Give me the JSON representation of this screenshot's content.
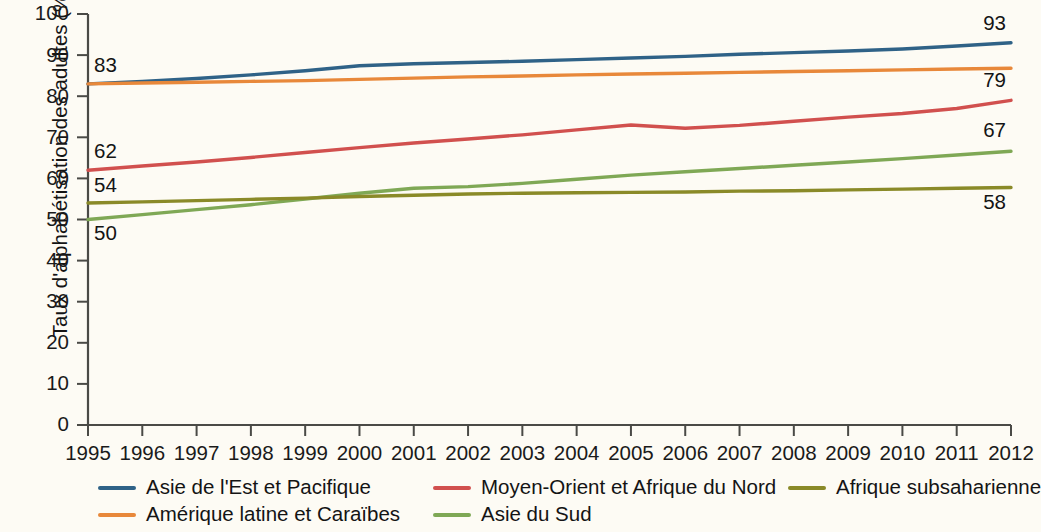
{
  "chart_data": {
    "type": "line",
    "title": "",
    "subtitle": "",
    "xlabel": "",
    "ylabel": "Taux d'alphabétisation des adultes (%)",
    "xlim": [
      1995,
      2012
    ],
    "ylim": [
      0,
      100
    ],
    "grid": false,
    "legend_position": "bottom",
    "x": [
      1995,
      1996,
      1997,
      1998,
      1999,
      2000,
      2001,
      2002,
      2003,
      2004,
      2005,
      2006,
      2007,
      2008,
      2009,
      2010,
      2011,
      2012
    ],
    "xtick_labels": [
      "1995",
      "1996",
      "1997",
      "1998",
      "1999",
      "2000",
      "2001",
      "2002",
      "2003",
      "2004",
      "2005",
      "2006",
      "2007",
      "2008",
      "2009",
      "2010",
      "2011",
      "2012"
    ],
    "ytick_labels": [
      "0",
      "10",
      "20",
      "30",
      "40",
      "50",
      "60",
      "70",
      "80",
      "90",
      "100"
    ],
    "ytick_values": [
      0,
      10,
      20,
      30,
      40,
      50,
      60,
      70,
      80,
      90,
      100
    ],
    "series": [
      {
        "name": "Asie de l'Est et Pacifique",
        "color": "#2f6287",
        "values": [
          83.0,
          83.6,
          84.3,
          85.2,
          86.2,
          87.4,
          87.9,
          88.2,
          88.5,
          88.9,
          89.3,
          89.7,
          90.2,
          90.6,
          91.0,
          91.5,
          92.2,
          93.0
        ],
        "start_label": "83",
        "end_label": "93"
      },
      {
        "name": "Amérique latine et Caraïbes",
        "color": "#e8883a",
        "values": [
          83.0,
          83.2,
          83.4,
          83.6,
          83.8,
          84.1,
          84.4,
          84.7,
          84.9,
          85.2,
          85.4,
          85.6,
          85.8,
          86.0,
          86.2,
          86.4,
          86.6,
          86.8
        ],
        "start_label": "",
        "end_label": ""
      },
      {
        "name": "Moyen-Orient et Afrique du Nord",
        "color": "#d1504e",
        "values": [
          62.0,
          63.0,
          64.0,
          65.1,
          66.3,
          67.5,
          68.6,
          69.6,
          70.6,
          71.8,
          73.0,
          72.2,
          72.9,
          73.9,
          74.9,
          75.8,
          77.0,
          79.0
        ],
        "start_label": "62",
        "end_label": "79"
      },
      {
        "name": "Asie du Sud",
        "color": "#7fa855",
        "values": [
          50.0,
          51.2,
          52.4,
          53.6,
          55.0,
          56.4,
          57.6,
          58.0,
          58.8,
          59.8,
          60.8,
          61.6,
          62.4,
          63.2,
          64.0,
          64.8,
          65.7,
          66.6
        ],
        "start_label": "50",
        "end_label": "67"
      },
      {
        "name": "Afrique subsaharienne",
        "color": "#8a8a28",
        "values": [
          54.0,
          54.3,
          54.6,
          54.9,
          55.2,
          55.6,
          55.9,
          56.2,
          56.4,
          56.5,
          56.6,
          56.7,
          56.9,
          57.0,
          57.2,
          57.4,
          57.6,
          57.8
        ],
        "start_label": "54",
        "end_label": "58"
      }
    ],
    "left_annotations": [
      {
        "text": "83",
        "value": 83,
        "series": "Asie de l'Est et Pacifique"
      },
      {
        "text": "62",
        "value": 62,
        "series": "Moyen-Orient et Afrique du Nord"
      },
      {
        "text": "54",
        "value": 54,
        "series": "Afrique subsaharienne"
      },
      {
        "text": "50",
        "value": 50,
        "series": "Asie du Sud"
      }
    ],
    "right_annotations": [
      {
        "text": "93",
        "value": 93,
        "series": "Asie de l'Est et Pacifique"
      },
      {
        "text": "79",
        "value": 79,
        "series": "Moyen-Orient et Afrique du Nord"
      },
      {
        "text": "67",
        "value": 67,
        "series": "Asie du Sud"
      },
      {
        "text": "58",
        "value": 58,
        "series": "Afrique subsaharienne"
      }
    ]
  },
  "legend": {
    "columns": [
      [
        {
          "label": "Asie de l'Est et Pacifique",
          "color": "#2f6287"
        },
        {
          "label": "Amérique latine et Caraïbes",
          "color": "#e8883a"
        }
      ],
      [
        {
          "label": "Moyen-Orient et Afrique du Nord",
          "color": "#d1504e"
        },
        {
          "label": "Asie du Sud",
          "color": "#7fa855"
        }
      ],
      [
        {
          "label": "Afrique subsaharienne",
          "color": "#8a8a28"
        }
      ]
    ]
  },
  "colors": {
    "background": "#fdfbf4",
    "axis": "#4a4a46",
    "text": "#141414"
  }
}
